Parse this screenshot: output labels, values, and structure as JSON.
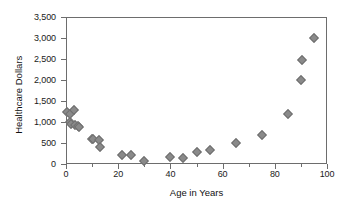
{
  "chart_data": {
    "type": "scatter",
    "title": "",
    "xlabel": "Age in Years",
    "ylabel": "Healthcare Dollars",
    "xlim": [
      0,
      100
    ],
    "ylim": [
      0,
      3500
    ],
    "grid": false,
    "legend": null,
    "marker_color": "#8a8a8a",
    "marker_edge_color": "#6f6f6f",
    "marker_shape": "diamond",
    "frame_color": "#6d6d6d",
    "text_color": "#1a1a1a",
    "x_ticks": [
      0,
      20,
      40,
      60,
      80,
      100
    ],
    "x_tick_labels": [
      "0",
      "20",
      "40",
      "60",
      "80",
      "100"
    ],
    "x_minor_ticks": [
      10,
      30,
      50,
      70,
      90
    ],
    "y_ticks": [
      0,
      500,
      1000,
      1500,
      2000,
      2500,
      3000,
      3500
    ],
    "y_tick_labels": [
      "0",
      "500",
      "1,000",
      "1,500",
      "2,000",
      "2,500",
      "3,000",
      "3,500"
    ],
    "points": [
      {
        "x": 0.5,
        "y": 1250
      },
      {
        "x": 1.5,
        "y": 1200
      },
      {
        "x": 1.5,
        "y": 1000
      },
      {
        "x": 2.0,
        "y": 960
      },
      {
        "x": 3.0,
        "y": 1290
      },
      {
        "x": 3.5,
        "y": 930
      },
      {
        "x": 4.5,
        "y": 900
      },
      {
        "x": 5.0,
        "y": 890
      },
      {
        "x": 10.0,
        "y": 600
      },
      {
        "x": 10.5,
        "y": 590
      },
      {
        "x": 12.5,
        "y": 560
      },
      {
        "x": 13.0,
        "y": 400
      },
      {
        "x": 21.5,
        "y": 205
      },
      {
        "x": 25.0,
        "y": 205
      },
      {
        "x": 30.0,
        "y": 80
      },
      {
        "x": 40.0,
        "y": 165
      },
      {
        "x": 45.0,
        "y": 145
      },
      {
        "x": 50.0,
        "y": 290
      },
      {
        "x": 55.0,
        "y": 345
      },
      {
        "x": 65.0,
        "y": 495
      },
      {
        "x": 75.0,
        "y": 685
      },
      {
        "x": 85.0,
        "y": 1185
      },
      {
        "x": 90.0,
        "y": 1990
      },
      {
        "x": 90.5,
        "y": 2480
      },
      {
        "x": 95.0,
        "y": 2990
      }
    ]
  }
}
